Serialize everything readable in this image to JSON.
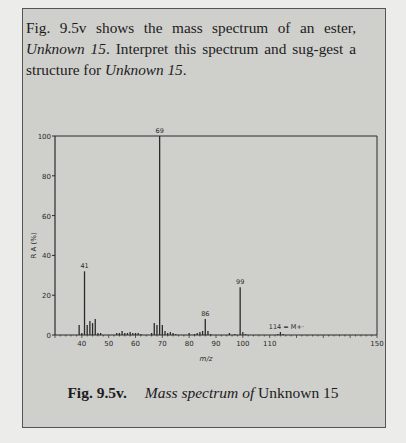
{
  "prompt": {
    "part1": "Fig. 9.5v shows the mass spectrum of an ester, ",
    "unknown_a": "Unknown 15",
    "part2": ". Interpret this spectrum and sug-gest a structure for ",
    "unknown_b": "Unknown 15",
    "part3": "."
  },
  "caption": {
    "fig_num": "Fig. 9.5v.",
    "italic_text": "Mass spectrum of",
    "plain_text": " Unknown 15"
  },
  "colors": {
    "panel_bg": "#cfcfcc",
    "page_bg": "#ececea",
    "ink": "#2a2a2a"
  },
  "chart_data": {
    "type": "bar",
    "title": "Mass spectrum of Unknown 15",
    "xlabel": "m/z",
    "ylabel": "R A (%)",
    "xlim": [
      30,
      150
    ],
    "ylim": [
      0,
      100
    ],
    "x_ticks": [
      40,
      50,
      60,
      70,
      80,
      90,
      100,
      110,
      150
    ],
    "y_ticks": [
      0,
      20,
      40,
      60,
      80,
      100
    ],
    "grid": false,
    "annotations": [
      {
        "x": 41,
        "label": "41"
      },
      {
        "x": 69,
        "label": "69"
      },
      {
        "x": 86,
        "label": "86"
      },
      {
        "x": 99,
        "label": "99"
      },
      {
        "x": 114,
        "label": "114 = M+·"
      }
    ],
    "peaks": [
      {
        "mz": 39,
        "ra": 5
      },
      {
        "mz": 40,
        "ra": 1
      },
      {
        "mz": 41,
        "ra": 32
      },
      {
        "mz": 42,
        "ra": 5
      },
      {
        "mz": 43,
        "ra": 7
      },
      {
        "mz": 44,
        "ra": 6
      },
      {
        "mz": 45,
        "ra": 8
      },
      {
        "mz": 46,
        "ra": 1
      },
      {
        "mz": 47,
        "ra": 1
      },
      {
        "mz": 53,
        "ra": 1
      },
      {
        "mz": 54,
        "ra": 1
      },
      {
        "mz": 55,
        "ra": 2
      },
      {
        "mz": 56,
        "ra": 1
      },
      {
        "mz": 57,
        "ra": 1
      },
      {
        "mz": 58,
        "ra": 1.5
      },
      {
        "mz": 59,
        "ra": 1
      },
      {
        "mz": 60,
        "ra": 1
      },
      {
        "mz": 61,
        "ra": 1
      },
      {
        "mz": 62,
        "ra": 0.5
      },
      {
        "mz": 66,
        "ra": 1
      },
      {
        "mz": 67,
        "ra": 6
      },
      {
        "mz": 68,
        "ra": 5
      },
      {
        "mz": 69,
        "ra": 100
      },
      {
        "mz": 70,
        "ra": 5
      },
      {
        "mz": 71,
        "ra": 2
      },
      {
        "mz": 72,
        "ra": 1
      },
      {
        "mz": 73,
        "ra": 1.5
      },
      {
        "mz": 74,
        "ra": 1
      },
      {
        "mz": 75,
        "ra": 0.5
      },
      {
        "mz": 80,
        "ra": 1
      },
      {
        "mz": 82,
        "ra": 0.5
      },
      {
        "mz": 83,
        "ra": 1
      },
      {
        "mz": 84,
        "ra": 1.5
      },
      {
        "mz": 85,
        "ra": 2
      },
      {
        "mz": 86,
        "ra": 8
      },
      {
        "mz": 87,
        "ra": 2
      },
      {
        "mz": 88,
        "ra": 0.5
      },
      {
        "mz": 95,
        "ra": 1
      },
      {
        "mz": 97,
        "ra": 0.5
      },
      {
        "mz": 99,
        "ra": 24
      },
      {
        "mz": 100,
        "ra": 1.5
      },
      {
        "mz": 101,
        "ra": 0.5
      },
      {
        "mz": 113,
        "ra": 0.5
      },
      {
        "mz": 114,
        "ra": 1.5
      },
      {
        "mz": 115,
        "ra": 0.5
      }
    ]
  }
}
